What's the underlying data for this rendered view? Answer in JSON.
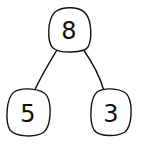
{
  "diagram": {
    "type": "number-bond-tree",
    "colors": {
      "stroke": "#111111",
      "background": "#ffffff"
    },
    "nodes": [
      {
        "id": "top",
        "label": "8"
      },
      {
        "id": "left",
        "label": "5"
      },
      {
        "id": "right",
        "label": "3"
      }
    ],
    "edges": [
      {
        "from": "top",
        "to": "left"
      },
      {
        "from": "top",
        "to": "right"
      }
    ]
  }
}
